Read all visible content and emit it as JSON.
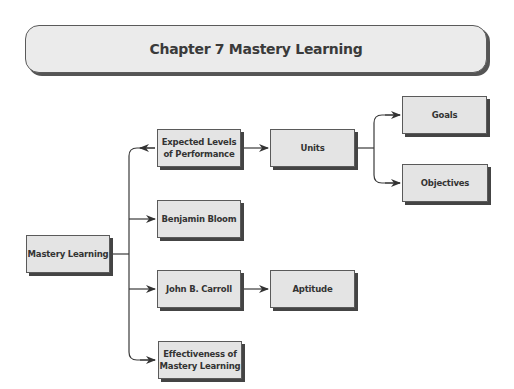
{
  "title": "Chapter 7 Mastery Learning",
  "nodes": {
    "root": "Mastery Learning",
    "expected": "Expected Levels\nof Performance",
    "bloom": "Benjamin Bloom",
    "carroll": "John B. Carroll",
    "effectiveness": "Effectiveness of\nMastery Learning",
    "units": "Units",
    "aptitude": "Aptitude",
    "goals": "Goals",
    "objectives": "Objectives"
  },
  "edges": [
    [
      "Mastery Learning",
      "Expected Levels of Performance"
    ],
    [
      "Mastery Learning",
      "Benjamin Bloom"
    ],
    [
      "Mastery Learning",
      "John B. Carroll"
    ],
    [
      "Mastery Learning",
      "Effectiveness of Mastery Learning"
    ],
    [
      "Expected Levels of Performance",
      "Units"
    ],
    [
      "Units",
      "Goals"
    ],
    [
      "Units",
      "Objectives"
    ],
    [
      "John B. Carroll",
      "Aptitude"
    ]
  ],
  "colors": {
    "box_fill": "#e4e4e4",
    "border": "#5a5a5a",
    "shadow": "#444444",
    "line": "#3a3a3a"
  }
}
